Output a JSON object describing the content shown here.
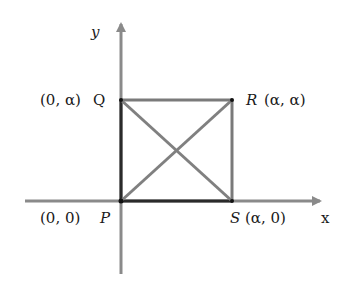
{
  "diagram": {
    "axes": {
      "x_label": "x",
      "y_label": "y"
    },
    "points": {
      "P": {
        "name": "P",
        "coords": "(0, 0)"
      },
      "Q": {
        "name": "Q",
        "coords": "(0, α)"
      },
      "R": {
        "name": "R",
        "coords": "(α, α)"
      },
      "S": {
        "name": "S",
        "coords": "(α, 0)"
      }
    },
    "shape": "square with diagonals PR and QS",
    "colors": {
      "axis": "#8a8a8a",
      "square_left_bottom": "#2a2a2a",
      "square_top_right": "#7a7a7a",
      "diagonals": "#808080",
      "text": "#1a1a1a"
    }
  }
}
